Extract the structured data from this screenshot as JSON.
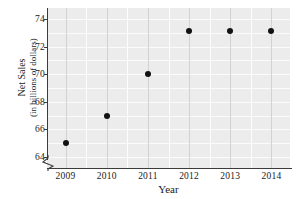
{
  "chart_data": {
    "type": "scatter",
    "title": "",
    "xlabel": "Year",
    "ylabel_line1": "Net Sales",
    "ylabel_line2": "(in billions of dollars)",
    "x": [
      2009,
      2010,
      2011,
      2012,
      2013,
      2014
    ],
    "categories": [
      "2009",
      "2010",
      "2011",
      "2012",
      "2013",
      "2014"
    ],
    "values": [
      65.0,
      67.0,
      70.0,
      73.1,
      73.1,
      73.1
    ],
    "series": [
      {
        "name": "Net Sales",
        "values": [
          65.0,
          67.0,
          70.0,
          73.1,
          73.1,
          73.1
        ]
      }
    ],
    "xtick_labels": [
      "2009",
      "2010",
      "2011",
      "2012",
      "2013",
      "2014"
    ],
    "ytick_labels": [
      "64",
      "66",
      "68",
      "70",
      "72",
      "74"
    ],
    "ytick_values": [
      64,
      66,
      68,
      70,
      72,
      74
    ],
    "ylim": [
      63.2,
      74.8
    ],
    "xlim": [
      2008.55,
      2014.45
    ],
    "grid": true,
    "grid_minor_step": 1,
    "legend": "none",
    "axis_break_y": true,
    "marker": "filled-circle",
    "colors": {
      "plot_background": "#ececec",
      "gridline": "#fbfbfb",
      "major_gridline": "#d2d2d2",
      "marker": "#121212",
      "axis": "#3b3b3b",
      "text": "#1a1a1a"
    }
  },
  "ytick_labels": {
    "t0": "64",
    "t1": "66",
    "t2": "68",
    "t3": "70",
    "t4": "72",
    "t5": "74"
  },
  "xtick_labels": {
    "t0": "2009",
    "t1": "2010",
    "t2": "2011",
    "t3": "2012",
    "t4": "2013",
    "t5": "2014"
  },
  "axis_titles": {
    "x": "Year",
    "y_line1": "Net Sales",
    "y_line2": "(in billions of dollars)"
  }
}
